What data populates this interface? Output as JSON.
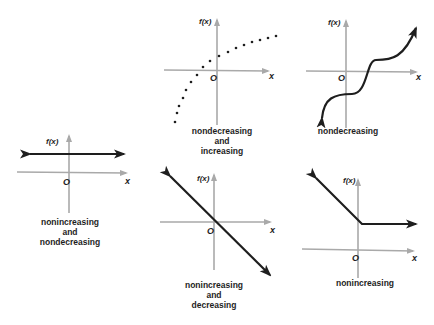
{
  "colors": {
    "axis": "#a9a9a9",
    "curve": "#1e1e1e",
    "background": "#ffffff"
  },
  "axis_labels": {
    "y": "f(x)",
    "x": "x",
    "origin": "O"
  },
  "graphs": [
    {
      "id": "constant",
      "caption": [
        "nonincreasing",
        "and",
        "nondecreasing"
      ],
      "description": "horizontal line above x-axis"
    },
    {
      "id": "increasing-dotted",
      "caption": [
        "nondecreasing",
        "and",
        "increasing"
      ],
      "description": "dotted increasing curve"
    },
    {
      "id": "nondecreasing-cubic",
      "caption": [
        "nondecreasing"
      ],
      "description": "S-shaped curve with flat step"
    },
    {
      "id": "decreasing-line",
      "caption": [
        "nonincreasing",
        "and",
        "decreasing"
      ],
      "description": "line with negative slope through origin"
    },
    {
      "id": "nonincreasing-piecewise",
      "caption": [
        "nonincreasing"
      ],
      "description": "decreasing line then flat ray"
    }
  ]
}
